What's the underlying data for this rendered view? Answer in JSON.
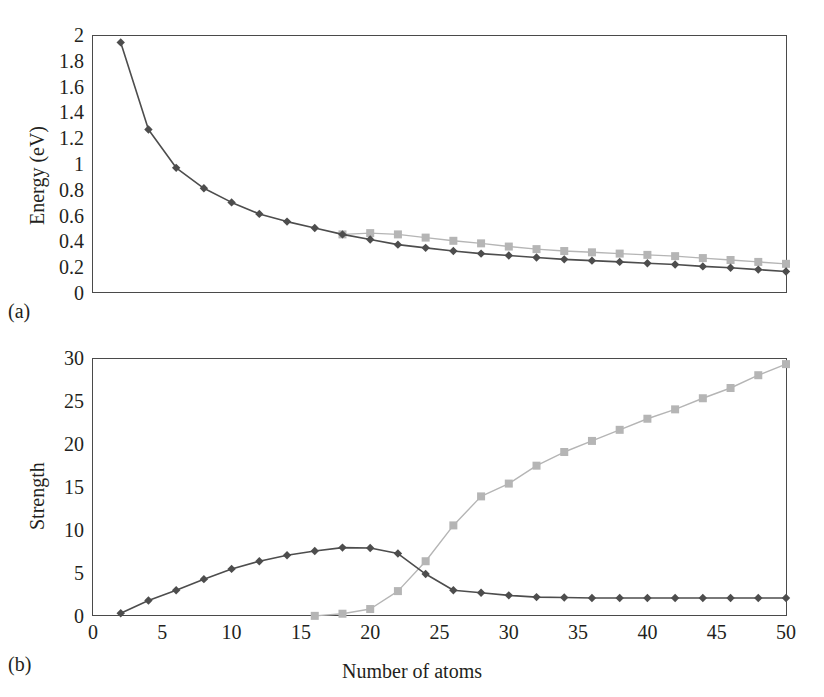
{
  "figure": {
    "panels": [
      {
        "tag": "(a)",
        "ylabel": "Energy (eV)",
        "xlabel": "",
        "yticks": [
          "0",
          "0.2",
          "0.4",
          "0.6",
          "0.8",
          "1",
          "1.2",
          "1.4",
          "1.6",
          "1.8",
          "2"
        ],
        "xticks": []
      },
      {
        "tag": "(b)",
        "ylabel": "Strength",
        "xlabel": "Number of atoms",
        "yticks": [
          "0",
          "5",
          "10",
          "15",
          "20",
          "25",
          "30"
        ],
        "xticks": [
          "0",
          "5",
          "10",
          "15",
          "20",
          "25",
          "30",
          "35",
          "40",
          "45",
          "50"
        ]
      }
    ]
  },
  "colors": {
    "series_dark": "#4d4d4d",
    "series_light": "#b5b5b5",
    "frame": "#4a4a4a",
    "text": "#231f20",
    "background": "#ffffff"
  },
  "chart_data": [
    {
      "type": "line",
      "panel": "(a)",
      "title": "",
      "xlabel": "",
      "ylabel": "Energy (eV)",
      "xlim": [
        0,
        50
      ],
      "ylim": [
        0,
        2
      ],
      "xticks": [
        0,
        5,
        10,
        15,
        20,
        25,
        30,
        35,
        40,
        45,
        50
      ],
      "yticks": [
        0,
        0.2,
        0.4,
        0.6,
        0.8,
        1,
        1.2,
        1.4,
        1.6,
        1.8,
        2
      ],
      "xtick_labels_shown": false,
      "grid": false,
      "legend": "none",
      "series": [
        {
          "name": "dark-diamond",
          "marker": "diamond",
          "color": "#4d4d4d",
          "x": [
            2,
            4,
            6,
            8,
            10,
            12,
            14,
            16,
            18,
            20,
            22,
            24,
            26,
            28,
            30,
            32,
            34,
            36,
            38,
            40,
            42,
            44,
            46,
            48,
            50
          ],
          "y": [
            1.95,
            1.27,
            0.97,
            0.81,
            0.7,
            0.61,
            0.55,
            0.5,
            0.45,
            0.41,
            0.37,
            0.345,
            0.32,
            0.3,
            0.285,
            0.27,
            0.255,
            0.245,
            0.235,
            0.225,
            0.215,
            0.2,
            0.19,
            0.175,
            0.16
          ]
        },
        {
          "name": "light-square",
          "marker": "square",
          "color": "#b5b5b5",
          "x": [
            18,
            20,
            22,
            24,
            26,
            28,
            30,
            32,
            34,
            36,
            38,
            40,
            42,
            44,
            46,
            48,
            50
          ],
          "y": [
            0.45,
            0.46,
            0.45,
            0.425,
            0.4,
            0.38,
            0.355,
            0.335,
            0.32,
            0.31,
            0.3,
            0.29,
            0.28,
            0.265,
            0.25,
            0.235,
            0.22
          ]
        }
      ]
    },
    {
      "type": "line",
      "panel": "(b)",
      "title": "",
      "xlabel": "Number of atoms",
      "ylabel": "Strength",
      "xlim": [
        0,
        50
      ],
      "ylim": [
        0,
        30
      ],
      "xticks": [
        0,
        5,
        10,
        15,
        20,
        25,
        30,
        35,
        40,
        45,
        50
      ],
      "yticks": [
        0,
        5,
        10,
        15,
        20,
        25,
        30
      ],
      "xtick_labels_shown": true,
      "grid": false,
      "legend": "none",
      "series": [
        {
          "name": "dark-diamond",
          "marker": "diamond",
          "color": "#4d4d4d",
          "x": [
            2,
            4,
            6,
            8,
            10,
            12,
            14,
            16,
            18,
            20,
            22,
            24,
            26,
            28,
            30,
            32,
            34,
            36,
            38,
            40,
            42,
            44,
            46,
            48,
            50
          ],
          "y": [
            0.2,
            1.7,
            2.9,
            4.2,
            5.4,
            6.3,
            7.0,
            7.5,
            7.9,
            7.85,
            7.2,
            4.8,
            2.9,
            2.6,
            2.3,
            2.1,
            2.05,
            2.0,
            2.0,
            2.0,
            2.0,
            2.0,
            2.0,
            2.0,
            2.0
          ]
        },
        {
          "name": "light-square",
          "marker": "square",
          "color": "#b5b5b5",
          "x": [
            16,
            18,
            20,
            22,
            24,
            26,
            28,
            30,
            32,
            34,
            36,
            38,
            40,
            42,
            44,
            46,
            48,
            50
          ],
          "y": [
            -0.1,
            0.15,
            0.7,
            2.8,
            6.3,
            10.5,
            13.9,
            15.4,
            17.5,
            19.1,
            20.4,
            21.7,
            23.0,
            24.1,
            25.4,
            26.6,
            28.1,
            29.4
          ]
        }
      ]
    }
  ]
}
